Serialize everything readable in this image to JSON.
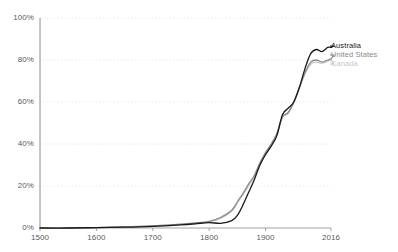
{
  "chart_data": {
    "type": "line",
    "title": "",
    "xlabel": "",
    "ylabel": "",
    "xlim": [
      1500,
      2016
    ],
    "ylim": [
      0,
      100
    ],
    "grid": true,
    "grid_axis": "y",
    "legend_position": "right",
    "y_tick_labels": [
      "0%",
      "20%",
      "40%",
      "60%",
      "80%",
      "100%"
    ],
    "y_ticks": [
      0,
      20,
      40,
      60,
      80,
      100
    ],
    "x_tick_labels": [
      "1500",
      "1600",
      "1700",
      "1800",
      "1900",
      "2016"
    ],
    "x_ticks": [
      1500,
      1600,
      1700,
      1800,
      1900,
      2016
    ],
    "x": [
      1500,
      1550,
      1600,
      1650,
      1700,
      1750,
      1775,
      1800,
      1820,
      1840,
      1850,
      1860,
      1870,
      1880,
      1890,
      1900,
      1910,
      1920,
      1930,
      1940,
      1950,
      1960,
      1970,
      1980,
      1990,
      2000,
      2010,
      2016
    ],
    "series": [
      {
        "name": "Australia",
        "color": "#1a1a1a",
        "values": [
          0,
          0,
          0.2,
          0.4,
          0.8,
          1.5,
          2.0,
          2.6,
          2.2,
          3.5,
          6.0,
          11.0,
          17.0,
          23.0,
          30.0,
          35.0,
          39.0,
          44.0,
          54.0,
          57.0,
          60.0,
          67.0,
          76.0,
          83.0,
          85.0,
          84.0,
          86.0,
          86.0
        ]
      },
      {
        "name": "United States",
        "color": "#8a8a8a",
        "values": [
          0,
          0,
          0.2,
          0.5,
          1.0,
          1.8,
          2.4,
          3.2,
          5.0,
          8.5,
          12.5,
          16.5,
          21.0,
          25.0,
          31.0,
          36.0,
          40.0,
          45.0,
          53.0,
          55.0,
          60.0,
          67.0,
          74.0,
          79.0,
          80.0,
          79.0,
          80.0,
          80.5
        ]
      },
      {
        "name": "Canada",
        "color": "#c8c8c8",
        "values": [
          0,
          0,
          0.2,
          0.5,
          1.0,
          1.7,
          2.3,
          3.0,
          4.6,
          8.0,
          12.0,
          16.0,
          20.0,
          24.5,
          30.0,
          35.0,
          39.5,
          44.5,
          52.5,
          54.5,
          59.5,
          66.5,
          73.5,
          78.0,
          79.0,
          78.5,
          79.5,
          80.0
        ]
      }
    ]
  },
  "legend": {
    "items": [
      {
        "label": "Australia"
      },
      {
        "label": "United States"
      },
      {
        "label": "Canada"
      }
    ]
  }
}
